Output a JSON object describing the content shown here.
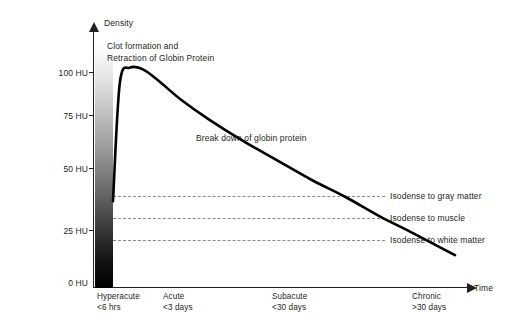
{
  "chart_data": {
    "type": "line",
    "title": "",
    "xlabel": "Time",
    "ylabel": "Density",
    "ylim": [
      0,
      112
    ],
    "yticks": [
      "0 HU",
      "25 HU",
      "50 HU",
      "75 HU",
      "100 HU"
    ],
    "ytick_values": [
      0,
      25,
      50,
      75,
      100
    ],
    "x_categories": [
      {
        "name": "Hyperacute",
        "sub": "<6 hrs"
      },
      {
        "name": "Acute",
        "sub": "<3 days"
      },
      {
        "name": "Subacute",
        "sub": "<30 days"
      },
      {
        "name": "Chronic",
        "sub": ">30 days"
      }
    ],
    "series": [
      {
        "name": "Hematoma density over time",
        "points": [
          {
            "x": 0.0,
            "y": 40
          },
          {
            "x": 0.02,
            "y": 95
          },
          {
            "x": 0.05,
            "y": 102
          },
          {
            "x": 0.09,
            "y": 101
          },
          {
            "x": 0.14,
            "y": 95
          },
          {
            "x": 0.2,
            "y": 87
          },
          {
            "x": 0.28,
            "y": 78
          },
          {
            "x": 0.38,
            "y": 68
          },
          {
            "x": 0.48,
            "y": 59
          },
          {
            "x": 0.58,
            "y": 50
          },
          {
            "x": 0.68,
            "y": 42
          },
          {
            "x": 0.78,
            "y": 33
          },
          {
            "x": 0.88,
            "y": 25
          },
          {
            "x": 1.0,
            "y": 15
          }
        ]
      }
    ],
    "reference_lines": [
      {
        "label": "Isodense to gray matter",
        "value": 40
      },
      {
        "label": "Isodense to muscle",
        "value": 32
      },
      {
        "label": "Isodense to white matter",
        "value": 25
      }
    ],
    "annotations": [
      {
        "id": "clot",
        "lines": [
          "Clot formation and",
          "Retraction of Globin Protein"
        ]
      },
      {
        "id": "breakdown",
        "lines": [
          "Break down of globin protein"
        ]
      }
    ],
    "grid": false,
    "legend": "none",
    "colors": {
      "curve": "#000000",
      "axis": "#231f20",
      "dashed": "#8a8a8a",
      "text": "#231f20"
    }
  }
}
